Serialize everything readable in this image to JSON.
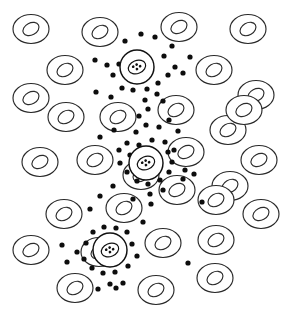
{
  "figure": {
    "background_color": "#ffffff",
    "width": 286,
    "height": 315,
    "legend_visible": false,
    "axes_visible": false
  },
  "style": {
    "rbc_stroke": "#2b2b2b",
    "rbc_fill": "#ffffff",
    "rbc_stroke_width": 1.15,
    "special_stroke": "#111111",
    "special_fill": "#ffffff",
    "special_stroke_width": 1.45,
    "platelet_color": "#0d0d0d",
    "granule_color": "#111111"
  },
  "counts": {
    "red_blood_cells": 36,
    "special_cells": 3,
    "platelets": 126
  },
  "chart_data": {
    "type": "scatter",
    "xlabel": "",
    "ylabel": "",
    "xlim": [
      0,
      286
    ],
    "ylim": [
      0,
      315
    ],
    "grid": false,
    "legend_position": "none",
    "series": [
      {
        "name": "red-blood-cell",
        "marker": "donut-ellipse",
        "outer_rx": 18,
        "outer_ry": 14.5,
        "inner_rx": 8.5,
        "inner_ry": 6,
        "points": [
          {
            "x": 31,
            "y": 29,
            "rot": -28
          },
          {
            "x": 100,
            "y": 32,
            "rot": -30
          },
          {
            "x": 179,
            "y": 27,
            "rot": -28
          },
          {
            "x": 248,
            "y": 29,
            "rot": -30
          },
          {
            "x": 65,
            "y": 70,
            "rot": -30
          },
          {
            "x": 214,
            "y": 70,
            "rot": -30
          },
          {
            "x": 31,
            "y": 98,
            "rot": -28
          },
          {
            "x": 256,
            "y": 95,
            "rot": -28
          },
          {
            "x": 66,
            "y": 117,
            "rot": -30
          },
          {
            "x": 118,
            "y": 117,
            "rot": -30
          },
          {
            "x": 176,
            "y": 110,
            "rot": -30
          },
          {
            "x": 228,
            "y": 130,
            "rot": -30
          },
          {
            "x": 40,
            "y": 162,
            "rot": -28
          },
          {
            "x": 95,
            "y": 160,
            "rot": -30
          },
          {
            "x": 186,
            "y": 152,
            "rot": -28
          },
          {
            "x": 259,
            "y": 160,
            "rot": -28
          },
          {
            "x": 177,
            "y": 190,
            "rot": -28
          },
          {
            "x": 230,
            "y": 186,
            "rot": -30
          },
          {
            "x": 64,
            "y": 214,
            "rot": -30
          },
          {
            "x": 124,
            "y": 208,
            "rot": -30
          },
          {
            "x": 216,
            "y": 200,
            "rot": -30
          },
          {
            "x": 261,
            "y": 214,
            "rot": -28
          },
          {
            "x": 31,
            "y": 250,
            "rot": -28
          },
          {
            "x": 163,
            "y": 243,
            "rot": -30
          },
          {
            "x": 216,
            "y": 240,
            "rot": -30
          },
          {
            "x": 75,
            "y": 288,
            "rot": -30
          },
          {
            "x": 156,
            "y": 290,
            "rot": -30
          },
          {
            "x": 215,
            "y": 278,
            "rot": -30
          },
          {
            "x": 141,
            "y": 175,
            "rot": -30
          },
          {
            "x": 244,
            "y": 110,
            "rot": -28
          },
          {
            "x": 99,
            "y": 252,
            "rot": -30
          }
        ]
      },
      {
        "name": "special-cell",
        "marker": "granulated-circle",
        "outer_r": 17,
        "inner_rx": 9,
        "inner_ry": 6.5,
        "points": [
          {
            "x": 137,
            "y": 67,
            "granules": 4
          },
          {
            "x": 146,
            "y": 163,
            "granules": 4
          },
          {
            "x": 110,
            "y": 250,
            "granules": 4
          }
        ]
      },
      {
        "name": "platelet",
        "marker": "dot",
        "r": 2.6,
        "points": [
          {
            "x": 141,
            "y": 34
          },
          {
            "x": 125,
            "y": 41
          },
          {
            "x": 164,
            "y": 56
          },
          {
            "x": 172,
            "y": 46
          },
          {
            "x": 155,
            "y": 37
          },
          {
            "x": 95,
            "y": 60
          },
          {
            "x": 107,
            "y": 65
          },
          {
            "x": 119,
            "y": 64
          },
          {
            "x": 113,
            "y": 75
          },
          {
            "x": 122,
            "y": 88
          },
          {
            "x": 133,
            "y": 90
          },
          {
            "x": 147,
            "y": 89
          },
          {
            "x": 158,
            "y": 83
          },
          {
            "x": 168,
            "y": 75
          },
          {
            "x": 175,
            "y": 67
          },
          {
            "x": 183,
            "y": 73
          },
          {
            "x": 157,
            "y": 94
          },
          {
            "x": 145,
            "y": 100
          },
          {
            "x": 96,
            "y": 92
          },
          {
            "x": 148,
            "y": 109
          },
          {
            "x": 163,
            "y": 101
          },
          {
            "x": 146,
            "y": 125
          },
          {
            "x": 159,
            "y": 127
          },
          {
            "x": 136,
            "y": 132
          },
          {
            "x": 169,
            "y": 120
          },
          {
            "x": 178,
            "y": 131
          },
          {
            "x": 100,
            "y": 137
          },
          {
            "x": 114,
            "y": 130
          },
          {
            "x": 127,
            "y": 143
          },
          {
            "x": 139,
            "y": 145
          },
          {
            "x": 152,
            "y": 140
          },
          {
            "x": 165,
            "y": 142
          },
          {
            "x": 119,
            "y": 150
          },
          {
            "x": 130,
            "y": 155
          },
          {
            "x": 168,
            "y": 152
          },
          {
            "x": 120,
            "y": 163
          },
          {
            "x": 127,
            "y": 172
          },
          {
            "x": 137,
            "y": 181
          },
          {
            "x": 148,
            "y": 184
          },
          {
            "x": 160,
            "y": 180
          },
          {
            "x": 169,
            "y": 172
          },
          {
            "x": 172,
            "y": 162
          },
          {
            "x": 174,
            "y": 150
          },
          {
            "x": 163,
            "y": 190
          },
          {
            "x": 150,
            "y": 194
          },
          {
            "x": 185,
            "y": 170
          },
          {
            "x": 183,
            "y": 179
          },
          {
            "x": 194,
            "y": 174
          },
          {
            "x": 100,
            "y": 196
          },
          {
            "x": 113,
            "y": 186
          },
          {
            "x": 90,
            "y": 209
          },
          {
            "x": 151,
            "y": 204
          },
          {
            "x": 202,
            "y": 202
          },
          {
            "x": 143,
            "y": 222
          },
          {
            "x": 93,
            "y": 232
          },
          {
            "x": 104,
            "y": 227
          },
          {
            "x": 116,
            "y": 228
          },
          {
            "x": 127,
            "y": 232
          },
          {
            "x": 86,
            "y": 243
          },
          {
            "x": 77,
            "y": 252
          },
          {
            "x": 84,
            "y": 259
          },
          {
            "x": 62,
            "y": 245
          },
          {
            "x": 132,
            "y": 244
          },
          {
            "x": 137,
            "y": 256
          },
          {
            "x": 128,
            "y": 266
          },
          {
            "x": 115,
            "y": 272
          },
          {
            "x": 103,
            "y": 273
          },
          {
            "x": 92,
            "y": 268
          },
          {
            "x": 67,
            "y": 262
          },
          {
            "x": 110,
            "y": 284
          },
          {
            "x": 123,
            "y": 283
          },
          {
            "x": 188,
            "y": 263
          },
          {
            "x": 98,
            "y": 289
          },
          {
            "x": 116,
            "y": 288
          },
          {
            "x": 111,
            "y": 97
          },
          {
            "x": 190,
            "y": 57
          },
          {
            "x": 139,
            "y": 116
          },
          {
            "x": 157,
            "y": 167
          },
          {
            "x": 133,
            "y": 199
          }
        ]
      }
    ]
  }
}
